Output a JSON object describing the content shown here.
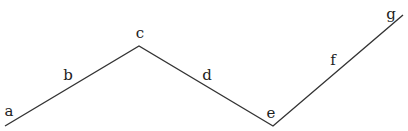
{
  "diagram": {
    "type": "polyline",
    "stroke_color": "#333333",
    "stroke_width": 1.4,
    "vertices": [
      {
        "x": 5,
        "y": 126
      },
      {
        "x": 139,
        "y": 46
      },
      {
        "x": 273,
        "y": 126
      },
      {
        "x": 403,
        "y": 15
      }
    ],
    "labels": [
      {
        "text": "a",
        "x": 9,
        "y": 111
      },
      {
        "text": "b",
        "x": 68,
        "y": 75
      },
      {
        "text": "c",
        "x": 140,
        "y": 33
      },
      {
        "text": "d",
        "x": 207,
        "y": 75
      },
      {
        "text": "e",
        "x": 271,
        "y": 113
      },
      {
        "text": "f",
        "x": 333,
        "y": 60
      },
      {
        "text": "g",
        "x": 391,
        "y": 14
      }
    ]
  }
}
